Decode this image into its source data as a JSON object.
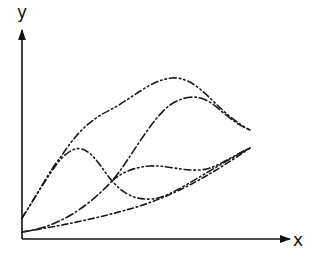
{
  "diagram": {
    "axes": {
      "x_label": "x",
      "y_label": "y",
      "color": "#111111"
    },
    "curves": [
      {
        "name": "curve-top",
        "style": "dash-dot-dot"
      },
      {
        "name": "curve-steep",
        "style": "dash-dot"
      },
      {
        "name": "curve-hump",
        "style": "dash-dot-dot"
      },
      {
        "name": "curve-plateau",
        "style": "dash-dot-dot"
      },
      {
        "name": "curve-bottom",
        "style": "dash-dot"
      }
    ],
    "line_color": "#1a1a1a"
  }
}
